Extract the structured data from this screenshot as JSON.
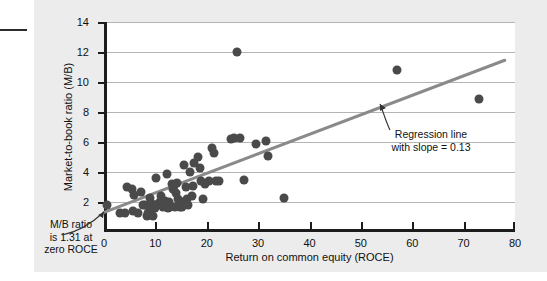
{
  "chart_data": {
    "type": "scatter",
    "title": "",
    "xlabel": "Return on common equity (ROCE)",
    "ylabel": "Market-to-book ratio (M/B)",
    "xlim": [
      0,
      80
    ],
    "ylim": [
      0,
      14
    ],
    "xticks": [
      0,
      10,
      20,
      30,
      40,
      50,
      60,
      70,
      80
    ],
    "yticks": [
      2,
      4,
      6,
      8,
      10,
      12,
      14
    ],
    "grid": "horizontal",
    "legend": "none",
    "series": [
      {
        "name": "Companies",
        "marker": "filled-circle",
        "color": "#4a4a4a",
        "points": [
          [
            0.5,
            1.8
          ],
          [
            3.2,
            1.3
          ],
          [
            4.0,
            1.3
          ],
          [
            4.4,
            3.0
          ],
          [
            5.4,
            2.9
          ],
          [
            5.6,
            1.4
          ],
          [
            5.9,
            2.5
          ],
          [
            6.6,
            1.3
          ],
          [
            7.2,
            2.7
          ],
          [
            7.6,
            1.8
          ],
          [
            8.0,
            1.8
          ],
          [
            8.3,
            1.1
          ],
          [
            8.6,
            1.3
          ],
          [
            8.9,
            2.3
          ],
          [
            9.2,
            1.5
          ],
          [
            9.4,
            1.9
          ],
          [
            9.6,
            1.1
          ],
          [
            9.9,
            1.6
          ],
          [
            10.2,
            3.6
          ],
          [
            10.6,
            1.9
          ],
          [
            10.9,
            2.0
          ],
          [
            11.1,
            2.4
          ],
          [
            11.4,
            1.7
          ],
          [
            11.8,
            2.1
          ],
          [
            12.2,
            3.9
          ],
          [
            12.4,
            1.6
          ],
          [
            12.6,
            2.0
          ],
          [
            12.9,
            1.7
          ],
          [
            13.2,
            3.2
          ],
          [
            13.4,
            2.9
          ],
          [
            13.6,
            3.1
          ],
          [
            13.8,
            1.7
          ],
          [
            14.0,
            2.6
          ],
          [
            14.2,
            3.3
          ],
          [
            14.5,
            2.2
          ],
          [
            14.8,
            1.7
          ],
          [
            15.1,
            1.7
          ],
          [
            15.4,
            2.0
          ],
          [
            15.6,
            4.5
          ],
          [
            15.9,
            3.0
          ],
          [
            16.2,
            2.2
          ],
          [
            16.4,
            1.8
          ],
          [
            16.8,
            4.0
          ],
          [
            17.1,
            2.4
          ],
          [
            17.4,
            3.1
          ],
          [
            17.6,
            4.6
          ],
          [
            18.3,
            5.0
          ],
          [
            18.6,
            4.3
          ],
          [
            18.8,
            3.4
          ],
          [
            19.2,
            2.2
          ],
          [
            19.6,
            3.2
          ],
          [
            20.4,
            3.4
          ],
          [
            21.0,
            5.6
          ],
          [
            21.4,
            5.3
          ],
          [
            21.8,
            3.4
          ],
          [
            22.4,
            3.4
          ],
          [
            24.8,
            6.2
          ],
          [
            25.4,
            6.3
          ],
          [
            25.9,
            12.0
          ],
          [
            26.4,
            6.3
          ],
          [
            27.3,
            3.5
          ],
          [
            29.6,
            5.9
          ],
          [
            31.6,
            6.1
          ],
          [
            32.0,
            5.1
          ],
          [
            35.0,
            2.3
          ],
          [
            57.0,
            10.8
          ],
          [
            73.0,
            8.9
          ]
        ]
      }
    ],
    "regression_line": {
      "label_line1": "Regression line",
      "label_line2": "with slope = 0.13",
      "slope": 0.13,
      "intercept": 1.31,
      "color": "#8a8a8a",
      "x_start": 0,
      "x_end": 78
    },
    "annotations": [
      {
        "name": "intercept-note",
        "line1": "M/B ratio",
        "line2": "is 1.31 at",
        "line3": "zero ROCE"
      }
    ]
  },
  "axis": {
    "y_title": "Market-to-book ratio (M/B)",
    "x_title": "Return on common equity (ROCE)",
    "y_ticks": [
      "2",
      "4",
      "6",
      "8",
      "10",
      "12",
      "14"
    ],
    "x_ticks": [
      "0",
      "10",
      "20",
      "30",
      "40",
      "50",
      "60",
      "70",
      "80"
    ]
  },
  "notes": {
    "left": "M/B ratio is 1.31 at zero ROCE",
    "left_l1": "M/B ratio",
    "left_l2": "is 1.31 at",
    "left_l3": "zero ROCE",
    "right_l1": "Regression line",
    "right_l2": "with slope = 0.13"
  },
  "colors": {
    "panel_bg": "#ececed",
    "plot_bg": "#ffffff",
    "axis": "#1c1c1c",
    "grid": "#b4b4b4",
    "marker": "#4a4a4a",
    "regression": "#8a8a8a",
    "text": "#111111"
  }
}
